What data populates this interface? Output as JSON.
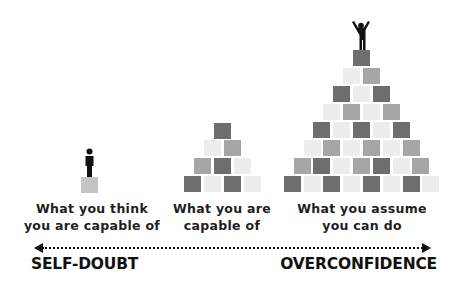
{
  "diagram": {
    "colors": {
      "dark": "#6e6e6e",
      "medium": "#a6a6a6",
      "light": "#ededed",
      "single": "#c4c4c4",
      "ink": "#111111"
    },
    "stages": [
      {
        "id": "think",
        "label_line1": "What you think",
        "label_line2": "you are capable of",
        "figure": "person-standing",
        "rows": [
          [
            "single"
          ]
        ]
      },
      {
        "id": "actual",
        "label_line1": "What you are",
        "label_line2": "capable of",
        "figure": null,
        "rows": [
          [
            "dark"
          ],
          [
            "light",
            "medium"
          ],
          [
            "medium",
            "dark",
            "light"
          ],
          [
            "dark",
            "light",
            "dark",
            "light"
          ]
        ]
      },
      {
        "id": "assume",
        "label_line1": "What you assume",
        "label_line2": "you can do",
        "figure": "person-arms-raised",
        "rows": [
          [
            "dark"
          ],
          [
            "light",
            "medium"
          ],
          [
            "dark",
            "light",
            "dark"
          ],
          [
            "light",
            "medium",
            "light",
            "medium"
          ],
          [
            "dark",
            "light",
            "dark",
            "light",
            "dark"
          ],
          [
            "light",
            "medium",
            "light",
            "medium",
            "light",
            "medium"
          ],
          [
            "medium",
            "dark",
            "light",
            "medium",
            "dark",
            "light",
            "medium"
          ],
          [
            "dark",
            "light",
            "dark",
            "light",
            "dark",
            "light",
            "dark",
            "light"
          ]
        ]
      }
    ],
    "axis": {
      "left_label": "SELF-DOUBT",
      "right_label": "OVERCONFIDENCE",
      "style": "dotted double-headed arrow"
    }
  }
}
